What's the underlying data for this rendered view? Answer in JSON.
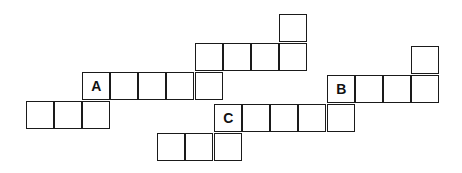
{
  "puzzle": {
    "type": "crossword-grid",
    "labels": [
      "A",
      "B",
      "C"
    ],
    "cells": [
      {
        "x": 280,
        "y": 15
      },
      {
        "x": 196,
        "y": 44
      },
      {
        "x": 224,
        "y": 44
      },
      {
        "x": 252,
        "y": 44
      },
      {
        "x": 280,
        "y": 44
      },
      {
        "x": 83,
        "y": 73,
        "label": "A"
      },
      {
        "x": 111,
        "y": 73
      },
      {
        "x": 139,
        "y": 73
      },
      {
        "x": 167,
        "y": 73
      },
      {
        "x": 196,
        "y": 73
      },
      {
        "x": 27,
        "y": 102
      },
      {
        "x": 55,
        "y": 102
      },
      {
        "x": 83,
        "y": 102
      },
      {
        "x": 412,
        "y": 47
      },
      {
        "x": 328,
        "y": 76,
        "label": "B"
      },
      {
        "x": 356,
        "y": 76
      },
      {
        "x": 384,
        "y": 76
      },
      {
        "x": 412,
        "y": 76
      },
      {
        "x": 215,
        "y": 105,
        "label": "C"
      },
      {
        "x": 243,
        "y": 105
      },
      {
        "x": 271,
        "y": 105
      },
      {
        "x": 299,
        "y": 105
      },
      {
        "x": 328,
        "y": 105
      },
      {
        "x": 158,
        "y": 134
      },
      {
        "x": 186,
        "y": 134
      },
      {
        "x": 215,
        "y": 134
      }
    ]
  }
}
